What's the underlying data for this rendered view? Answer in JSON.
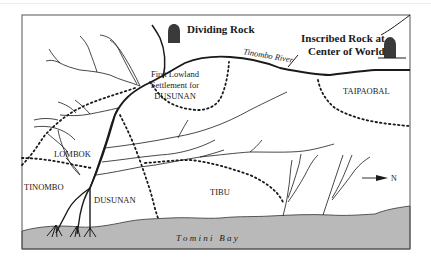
{
  "map": {
    "colors": {
      "background": "#ffffff",
      "bay_fill": "#b9b9b9",
      "line": "#1a1a1a",
      "rock": "#3a3a3a",
      "frame": "#555555"
    },
    "landmarks": {
      "dividing_rock": "Dividing Rock",
      "inscribed_rock_line1": "Inscribed Rock at",
      "inscribed_rock_line2": "Center of World"
    },
    "river": {
      "name": "Tinombo River"
    },
    "settlement": {
      "line1": "First Lowland",
      "line2": "Settlement for",
      "line3": "DUSUNAN"
    },
    "regions": [
      {
        "id": "taipaobal",
        "label": "TAIPAOBAL"
      },
      {
        "id": "lombok",
        "label": "LOMBOK"
      },
      {
        "id": "tinombo",
        "label": "TINOMBO"
      },
      {
        "id": "dusunan",
        "label": "DUSUNAN"
      },
      {
        "id": "tibu",
        "label": "TIBU"
      }
    ],
    "water": {
      "bay_label": "T o m i n i   B a y"
    },
    "compass": {
      "icon": "north-arrow-icon",
      "label": "N"
    }
  }
}
